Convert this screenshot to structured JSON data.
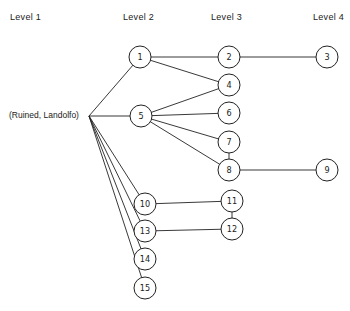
{
  "diagram": {
    "levels": [
      {
        "label": "Level 1",
        "x": 10
      },
      {
        "label": "Level 2",
        "x": 123
      },
      {
        "label": "Level 3",
        "x": 211
      },
      {
        "label": "Level 4",
        "x": 313
      }
    ],
    "root": {
      "label": "(Ruined, Landolfo)",
      "x": 9,
      "y": 116,
      "anchor_x": 89,
      "anchor_y": 116
    },
    "node_radius": 11,
    "nodes": [
      {
        "id": "1",
        "x": 140,
        "y": 57
      },
      {
        "id": "2",
        "x": 229,
        "y": 57
      },
      {
        "id": "3",
        "x": 327,
        "y": 57
      },
      {
        "id": "4",
        "x": 229,
        "y": 85
      },
      {
        "id": "5",
        "x": 141,
        "y": 116
      },
      {
        "id": "6",
        "x": 229,
        "y": 113
      },
      {
        "id": "7",
        "x": 229,
        "y": 142
      },
      {
        "id": "8",
        "x": 229,
        "y": 170
      },
      {
        "id": "9",
        "x": 327,
        "y": 170
      },
      {
        "id": "10",
        "x": 145,
        "y": 204
      },
      {
        "id": "11",
        "x": 232,
        "y": 201
      },
      {
        "id": "12",
        "x": 232,
        "y": 229
      },
      {
        "id": "13",
        "x": 145,
        "y": 231
      },
      {
        "id": "14",
        "x": 145,
        "y": 259
      },
      {
        "id": "15",
        "x": 145,
        "y": 288
      }
    ],
    "edges": [
      [
        "root",
        "1"
      ],
      [
        "root",
        "5"
      ],
      [
        "root",
        "10"
      ],
      [
        "root",
        "13"
      ],
      [
        "root",
        "14"
      ],
      [
        "root",
        "15"
      ],
      [
        "1",
        "2"
      ],
      [
        "1",
        "4"
      ],
      [
        "2",
        "3"
      ],
      [
        "5",
        "4"
      ],
      [
        "5",
        "6"
      ],
      [
        "5",
        "7"
      ],
      [
        "5",
        "8"
      ],
      [
        "7",
        "8"
      ],
      [
        "8",
        "9"
      ],
      [
        "10",
        "11"
      ],
      [
        "11",
        "12"
      ],
      [
        "13",
        "12"
      ]
    ]
  }
}
